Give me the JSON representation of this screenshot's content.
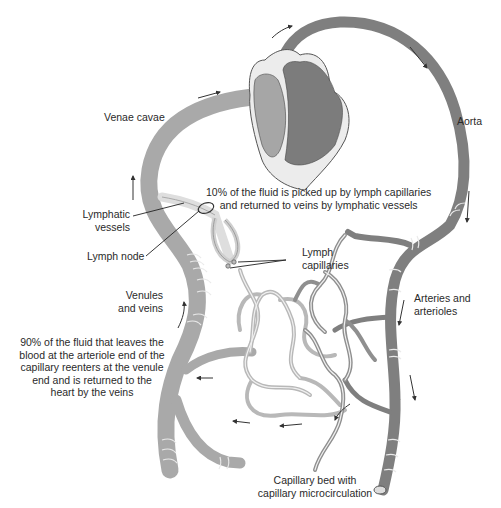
{
  "diagram": {
    "type": "circulatory-lymphatic-schematic",
    "colors": {
      "vein": "#a9a9a9",
      "vein_light": "#c4c4c4",
      "artery": "#7f7f7f",
      "heart_right": "#a6a6a6",
      "heart_left": "#7c7c7c",
      "heart_wall": "#ececec",
      "lymph": "#dedede",
      "outline": "#555555",
      "ring": "#e8e8e8",
      "text": "#2a2a2a"
    },
    "labels": {
      "venae_cavae": "Venae cavae",
      "aorta": "Aorta",
      "lymph_fluid_note": "10% of the fluid is picked up by lymph capillaries\nand returned to veins by lymphatic vessels",
      "lymphatic_vessels": "Lymphatic\nvessels",
      "lymph_node": "Lymph node",
      "lymph_capillaries": "Lymph\ncapillaries",
      "venules_and_veins": "Venules\nand veins",
      "arteries_and_arterioles": "Arteries and\narterioles",
      "venous_return_note": "90% of the fluid that leaves the\nblood at the arteriole end of the\ncapillary reenters at the venule\nend and is returned to the\nheart by the veins",
      "capillary_bed": "Capillary bed with\ncapillary microcirculation"
    },
    "flow_arrows": [
      "arrow-venae-cavae-top",
      "arrow-vein-up",
      "arrow-aorta-top",
      "arrow-aorta-right-1",
      "arrow-aorta-right-2",
      "arrow-artery-down-1",
      "arrow-artery-down-2",
      "arrow-capillary-1",
      "arrow-capillary-2",
      "arrow-capillary-3",
      "arrow-capillary-4"
    ]
  }
}
